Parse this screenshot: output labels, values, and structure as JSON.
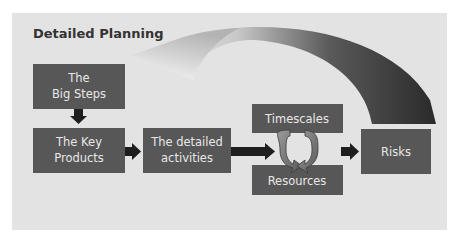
{
  "title": "Detailed Planning",
  "boxes": {
    "big_steps": {
      "line1": "The",
      "line2": "Big Steps"
    },
    "key_products": {
      "line1": "The Key",
      "line2": "Products"
    },
    "detailed_activities": {
      "line1": "The detailed",
      "line2": "activities"
    },
    "timescales": {
      "label": "Timescales"
    },
    "resources": {
      "label": "Resources"
    },
    "risks": {
      "label": "Risks"
    }
  },
  "icons": {
    "down_arrow": "arrow-down-icon",
    "right_arrows": "arrow-right-icon",
    "cycle": "circular-arrows-icon",
    "swoosh": "curved-feedback-arrow-icon"
  },
  "colors": {
    "background": "#e3e3e3",
    "box_fill": "#575757",
    "box_text": "#e8e8e8",
    "arrow": "#1e1e1e",
    "title_text": "#333333",
    "swoosh_dark": "#2e2e2e",
    "swoosh_light": "#f7f7f7"
  }
}
